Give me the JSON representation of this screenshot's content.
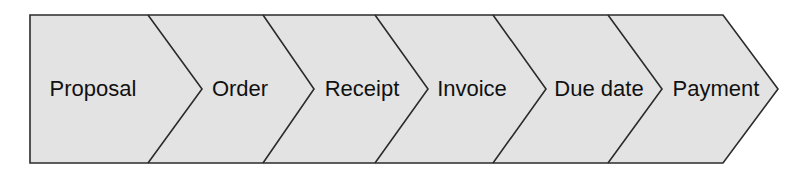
{
  "diagram": {
    "name": "process-flow-chevron",
    "type": "chevron-process-flow",
    "orientation": "left-to-right",
    "fill_color": "#e3e3e3",
    "stroke_color": "#2b2b2b",
    "background_color": "#ffffff",
    "text_color": "#111111",
    "stage_count": 6,
    "stages": [
      {
        "label": "Proposal",
        "index": 1,
        "center_x": 93,
        "center_y": 89
      },
      {
        "label": "Order",
        "index": 2,
        "center_x": 240,
        "center_y": 89
      },
      {
        "label": "Receipt",
        "index": 3,
        "center_x": 362,
        "center_y": 89
      },
      {
        "label": "Invoice",
        "index": 4,
        "center_x": 472,
        "center_y": 89
      },
      {
        "label": "Due date",
        "index": 5,
        "center_x": 599,
        "center_y": 89
      },
      {
        "label": "Payment",
        "index": 6,
        "center_x": 716,
        "center_y": 89
      }
    ],
    "geometry": {
      "left": 30,
      "top": 15,
      "bottom": 163,
      "body_right": 723,
      "tip_x": 778,
      "mid_y": 89,
      "divider_tops": [
        148,
        263,
        375,
        493,
        608
      ],
      "divider_tips": [
        202,
        314,
        428,
        546,
        662
      ],
      "stroke_width": 1.6
    }
  },
  "artifacts": {
    "note": "faint ghost text bleeding through from reverse side of scanned page",
    "ghosts": [
      {
        "text": "section",
        "x": 612,
        "y": 30,
        "size": 17
      },
      {
        "text": "sont",
        "x": 188,
        "y": 88,
        "size": 19
      },
      {
        "text": "niteriur",
        "x": 616,
        "y": 44,
        "size": 16
      },
      {
        "text": "un",
        "x": 300,
        "y": 88,
        "size": 18
      },
      {
        "text": "quantite",
        "x": 60,
        "y": 128,
        "size": 18
      },
      {
        "text": "certaine",
        "x": 196,
        "y": 128,
        "size": 18
      },
      {
        "text": "nocessaires",
        "x": 330,
        "y": 128,
        "size": 18
      },
      {
        "text": "uvu",
        "x": 470,
        "y": 128,
        "size": 18
      }
    ]
  }
}
